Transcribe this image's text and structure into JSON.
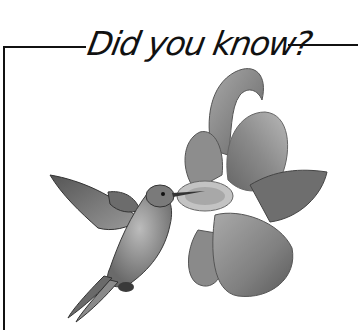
{
  "header": {
    "title": "Did you know?"
  },
  "illustration": {
    "subject": "hummingbird-feeding-from-flower",
    "style": "grayscale pencil drawing",
    "colors": {
      "line": "#111111",
      "background": "#ffffff",
      "shade_dark": "#4a4a4a",
      "shade_mid": "#7d7d7d",
      "shade_light": "#b5b5b5"
    }
  }
}
